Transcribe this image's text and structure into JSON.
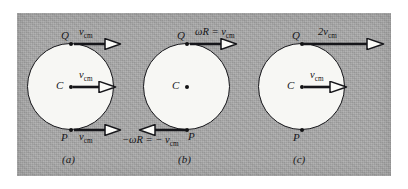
{
  "figure": {
    "caption_a": "(a)",
    "caption_b": "(b)",
    "caption_c": "(c)",
    "panel_color": "#a8a8a8",
    "disk_color": "#f7f7f4",
    "ink_color": "#16161a",
    "panels": [
      {
        "id": "a",
        "caption": "(a)",
        "center_label": "C",
        "top_point_label": "Q",
        "bottom_point_label": "P",
        "center_vector_label": "v",
        "center_vector_sub": "cm",
        "top_vector_label": "v",
        "top_vector_sub": "cm",
        "bottom_vector_label": "v",
        "bottom_vector_sub": "cm",
        "top_vector_direction": "right",
        "bottom_vector_direction": "right",
        "center_vector_direction": "right"
      },
      {
        "id": "b",
        "caption": "(b)",
        "center_label": "C",
        "top_point_label": "Q",
        "bottom_point_label": "P",
        "center_vector_label": "",
        "top_vector_label": "ωR = v",
        "top_vector_sub": "cm",
        "bottom_vector_label": "−ωR = − v",
        "bottom_vector_sub": "cm",
        "top_vector_direction": "right",
        "bottom_vector_direction": "left",
        "center_vector_direction": "none"
      },
      {
        "id": "c",
        "caption": "(c)",
        "center_label": "C",
        "top_point_label": "Q",
        "bottom_point_label": "P",
        "center_vector_label": "v",
        "center_vector_sub": "cm",
        "top_vector_label": "2v",
        "top_vector_sub": "cm",
        "bottom_vector_label": "",
        "top_vector_direction": "right",
        "bottom_vector_direction": "none",
        "center_vector_direction": "right"
      }
    ]
  }
}
